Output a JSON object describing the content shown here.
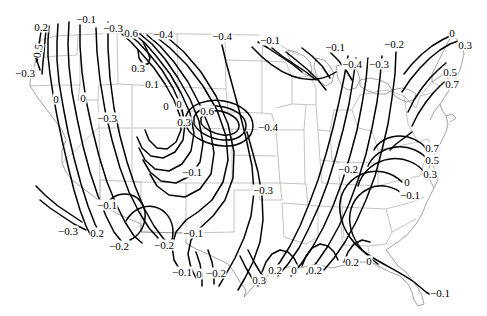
{
  "figure": {
    "kind": "contour-map",
    "region": "contiguous-united-states",
    "width": 487,
    "height": 316,
    "background_color": "#ffffff",
    "contour_color": "#000000",
    "state_border_color": "#a9a9a9",
    "coastline_color": "#8c8c8c"
  },
  "chart_data": {
    "type": "contour",
    "title": "",
    "subtitle": "",
    "xlabel": "",
    "ylabel": "",
    "grid": false,
    "legend": "none",
    "contour_interval": 0.1,
    "levels": [
      -0.4,
      -0.3,
      -0.2,
      -0.1,
      0,
      0.1,
      0.2,
      0.3,
      0.5,
      0.6,
      0.7
    ],
    "value_range": [
      -0.4,
      0.7
    ],
    "extrema": [
      {
        "kind": "maximum",
        "value": 0.6,
        "x": 227,
        "y": 116
      },
      {
        "kind": "maximum",
        "value": 0.7,
        "x": 440,
        "y": 83
      },
      {
        "kind": "maximum",
        "value": 0.7,
        "x": 420,
        "y": 147
      }
    ],
    "labels": [
      {
        "text": "0.2",
        "value": 0.2,
        "x": 41,
        "y": 27,
        "rotated": false
      },
      {
        "text": "−0.1",
        "value": -0.1,
        "x": 86,
        "y": 19,
        "rotated": false
      },
      {
        "text": "−0.3",
        "value": -0.3,
        "x": 113,
        "y": 28,
        "rotated": false
      },
      {
        "text": "0.6",
        "value": 0.6,
        "x": 131,
        "y": 33,
        "rotated": false
      },
      {
        "text": "−0.4",
        "value": -0.4,
        "x": 163,
        "y": 34,
        "rotated": false
      },
      {
        "text": "−0.4",
        "value": -0.4,
        "x": 222,
        "y": 36,
        "rotated": false
      },
      {
        "text": "−0.1",
        "value": -0.1,
        "x": 270,
        "y": 40,
        "rotated": false
      },
      {
        "text": "−0.1",
        "value": -0.1,
        "x": 335,
        "y": 47,
        "rotated": false
      },
      {
        "text": "−0.2",
        "value": -0.2,
        "x": 394,
        "y": 44,
        "rotated": false
      },
      {
        "text": "0",
        "value": 0,
        "x": 452,
        "y": 33,
        "rotated": false
      },
      {
        "text": "0.3",
        "value": 0.3,
        "x": 465,
        "y": 45,
        "rotated": false
      },
      {
        "text": "0.5",
        "value": 0.5,
        "x": 38,
        "y": 51,
        "rotated": true
      },
      {
        "text": "−0.3",
        "value": -0.3,
        "x": 25,
        "y": 73,
        "rotated": false
      },
      {
        "text": "0.3",
        "value": 0.3,
        "x": 138,
        "y": 68,
        "rotated": false
      },
      {
        "text": "−0.4",
        "value": -0.4,
        "x": 352,
        "y": 64,
        "rotated": false
      },
      {
        "text": "−0.3",
        "value": -0.3,
        "x": 379,
        "y": 64,
        "rotated": false
      },
      {
        "text": "0.5",
        "value": 0.5,
        "x": 450,
        "y": 72,
        "rotated": false
      },
      {
        "text": "0.7",
        "value": 0.7,
        "x": 452,
        "y": 84,
        "rotated": false
      },
      {
        "text": "0.1",
        "value": 0.1,
        "x": 152,
        "y": 84,
        "rotated": false
      },
      {
        "text": "0",
        "value": 0,
        "x": 56,
        "y": 99,
        "rotated": false
      },
      {
        "text": "0",
        "value": 0,
        "x": 83,
        "y": 98,
        "rotated": false
      },
      {
        "text": "0",
        "value": 0,
        "x": 166,
        "y": 106,
        "rotated": false
      },
      {
        "text": "0",
        "value": 0,
        "x": 179,
        "y": 104,
        "rotated": false
      },
      {
        "text": "0.6",
        "value": 0.6,
        "x": 207,
        "y": 111,
        "rotated": false
      },
      {
        "text": "0.3",
        "value": 0.3,
        "x": 184,
        "y": 122,
        "rotated": false
      },
      {
        "text": "−0.4",
        "value": -0.4,
        "x": 268,
        "y": 127,
        "rotated": false
      },
      {
        "text": "−0.3",
        "value": -0.3,
        "x": 107,
        "y": 118,
        "rotated": false
      },
      {
        "text": "0.7",
        "value": 0.7,
        "x": 432,
        "y": 148,
        "rotated": false
      },
      {
        "text": "0.5",
        "value": 0.5,
        "x": 432,
        "y": 160,
        "rotated": false
      },
      {
        "text": "0.3",
        "value": 0.3,
        "x": 430,
        "y": 174,
        "rotated": false
      },
      {
        "text": "−0.1",
        "value": -0.1,
        "x": 192,
        "y": 172,
        "rotated": false
      },
      {
        "text": "−0.2",
        "value": -0.2,
        "x": 348,
        "y": 169,
        "rotated": false
      },
      {
        "text": "−0.3",
        "value": -0.3,
        "x": 263,
        "y": 190,
        "rotated": false
      },
      {
        "text": "0",
        "value": 0,
        "x": 407,
        "y": 182,
        "rotated": false
      },
      {
        "text": "−0.1",
        "value": -0.1,
        "x": 410,
        "y": 195,
        "rotated": false
      },
      {
        "text": "−0.1",
        "value": -0.1,
        "x": 107,
        "y": 205,
        "rotated": false
      },
      {
        "text": "−0.3",
        "value": -0.3,
        "x": 68,
        "y": 231,
        "rotated": false
      },
      {
        "text": "0.2",
        "value": 0.2,
        "x": 97,
        "y": 233,
        "rotated": false
      },
      {
        "text": "−0.2",
        "value": -0.2,
        "x": 119,
        "y": 246,
        "rotated": false
      },
      {
        "text": "−0.2",
        "value": -0.2,
        "x": 164,
        "y": 245,
        "rotated": false
      },
      {
        "text": "−0.1",
        "value": -0.1,
        "x": 193,
        "y": 233,
        "rotated": false
      },
      {
        "text": "−0.1",
        "value": -0.1,
        "x": 182,
        "y": 272,
        "rotated": false
      },
      {
        "text": "0",
        "value": 0,
        "x": 199,
        "y": 274,
        "rotated": false
      },
      {
        "text": "−0.2",
        "value": -0.2,
        "x": 216,
        "y": 273,
        "rotated": false
      },
      {
        "text": "0.3",
        "value": 0.3,
        "x": 259,
        "y": 280,
        "rotated": false
      },
      {
        "text": "0.2",
        "value": 0.2,
        "x": 275,
        "y": 270,
        "rotated": false
      },
      {
        "text": "0",
        "value": 0,
        "x": 294,
        "y": 270,
        "rotated": false
      },
      {
        "text": "0.2",
        "value": 0.2,
        "x": 315,
        "y": 270,
        "rotated": false
      },
      {
        "text": "0.2",
        "value": 0.2,
        "x": 352,
        "y": 262,
        "rotated": false
      },
      {
        "text": "0",
        "value": 0,
        "x": 369,
        "y": 261,
        "rotated": false
      },
      {
        "text": "−0.1",
        "value": -0.1,
        "x": 440,
        "y": 293,
        "rotated": false
      }
    ]
  }
}
